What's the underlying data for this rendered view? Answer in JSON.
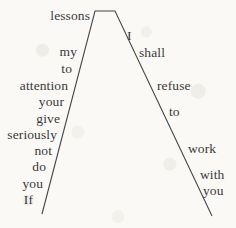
{
  "figure": {
    "background_color": "#faf9f6",
    "stroke_color": "#46464a",
    "text_color": "#3a3a3c"
  },
  "lines": {
    "apex_left_x": 95,
    "apex_right_x": 115,
    "apex_y": 11,
    "left_foot_x": 42,
    "left_foot_y": 214,
    "right_foot_x": 212,
    "right_foot_y": 216
  },
  "left_branch": {
    "reading_order": "bottom-to-top",
    "sentence": "If you do not seriously give your attention to my lessons",
    "words": [
      {
        "text": "lessons",
        "right_x": 90,
        "baseline_y": 22
      },
      {
        "text": "my",
        "right_x": 77,
        "baseline_y": 58
      },
      {
        "text": "to",
        "right_x": 72,
        "baseline_y": 75
      },
      {
        "text": "attention",
        "right_x": 68,
        "baseline_y": 92
      },
      {
        "text": "your",
        "right_x": 64,
        "baseline_y": 108
      },
      {
        "text": "give",
        "right_x": 60,
        "baseline_y": 125
      },
      {
        "text": "seriously",
        "right_x": 57,
        "baseline_y": 141
      },
      {
        "text": "not",
        "right_x": 52,
        "baseline_y": 157
      },
      {
        "text": "do",
        "right_x": 46,
        "baseline_y": 173
      },
      {
        "text": "you",
        "right_x": 43,
        "baseline_y": 190
      },
      {
        "text": "If",
        "right_x": 33,
        "baseline_y": 206
      }
    ]
  },
  "right_branch": {
    "reading_order": "top-to-bottom",
    "sentence": "I shall refuse to work with you",
    "words": [
      {
        "text": "I",
        "left_x": 127,
        "baseline_y": 42
      },
      {
        "text": "shall",
        "left_x": 139,
        "baseline_y": 59
      },
      {
        "text": "refuse",
        "left_x": 157,
        "baseline_y": 92
      },
      {
        "text": "to",
        "left_x": 169,
        "baseline_y": 118
      },
      {
        "text": "work",
        "left_x": 188,
        "baseline_y": 155
      },
      {
        "text": "with",
        "left_x": 200,
        "baseline_y": 181
      },
      {
        "text": "you",
        "left_x": 203,
        "baseline_y": 197
      }
    ]
  },
  "full_text": "If you do not seriously give your attention to my lessons I shall refuse to work with you"
}
